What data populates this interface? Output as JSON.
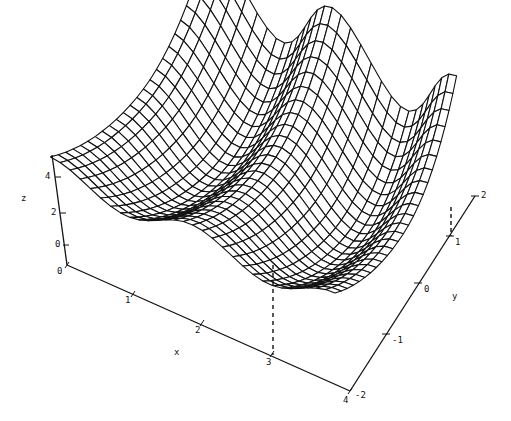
{
  "chart_data": {
    "type": "surface3d",
    "title": "",
    "xlabel": "x",
    "ylabel": "y",
    "zlabel": "z",
    "xlim": [
      0,
      4
    ],
    "ylim": [
      -2,
      2
    ],
    "zlim": [
      -1.2,
      4.5
    ],
    "x_ticks": [
      0,
      1,
      2,
      3,
      4
    ],
    "y_ticks": [
      -2,
      -1,
      0,
      1,
      2
    ],
    "z_ticks": [
      0,
      2,
      4
    ],
    "x_tick_labels": [
      "0",
      "1",
      "2",
      "3",
      "4"
    ],
    "y_tick_labels": [
      "-2",
      "-1",
      "0",
      "1",
      "2"
    ],
    "z_tick_labels": [
      "0",
      "2",
      "4"
    ],
    "grid": false,
    "mesh": {
      "nx": 30,
      "ny": 24,
      "style": "wireframe",
      "line_color": "#111111"
    },
    "annotation": {
      "type": "dashed-drop-line",
      "x": 3,
      "y": 1,
      "note": "vertical dashed lines from surface minimum near (3,1) down to x-axis tick 3 and y-axis tick 1"
    },
    "sample_points": [
      {
        "x": 0,
        "y": -2,
        "z": 4.0
      },
      {
        "x": 0,
        "y": 2,
        "z": 4.0
      },
      {
        "x": 1,
        "y": 1,
        "z": 0.2
      },
      {
        "x": 3,
        "y": 1,
        "z": 0.0
      },
      {
        "x": 0.5,
        "y": 2,
        "z": 5.0
      },
      {
        "x": 2.5,
        "y": 2,
        "z": 4.2
      },
      {
        "x": 4,
        "y": 2,
        "z": 3.6
      }
    ]
  },
  "axes": {
    "x_label": "x",
    "y_label": "y",
    "z_label": "z",
    "x_ticks": [
      "0",
      "1",
      "2",
      "3",
      "4"
    ],
    "y_ticks": [
      "-2",
      "-1",
      "0",
      "1",
      "2"
    ],
    "z_ticks": [
      "0",
      "2",
      "4"
    ]
  }
}
